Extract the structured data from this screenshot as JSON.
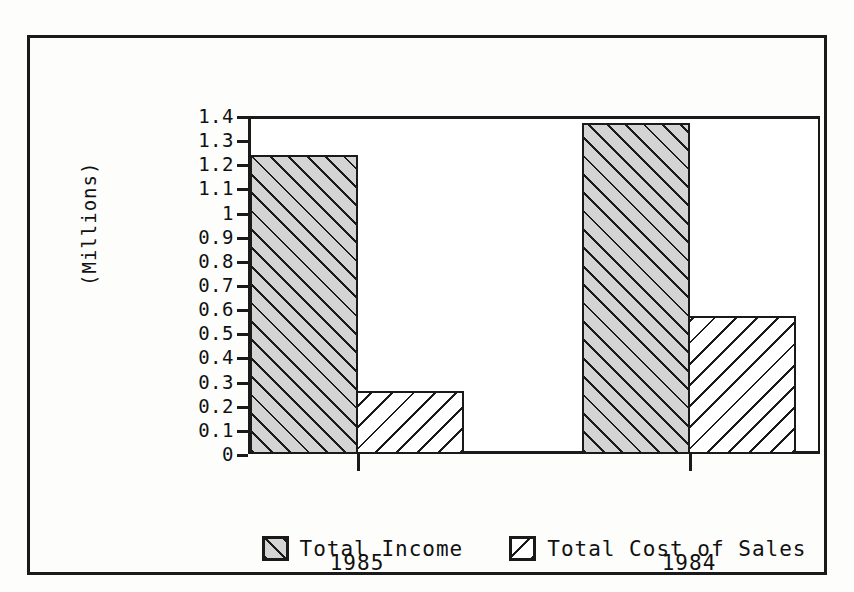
{
  "chart_data": {
    "type": "bar",
    "title": "",
    "xlabel": "",
    "ylabel": "(Millions)",
    "categories": [
      "1985",
      "1984"
    ],
    "series": [
      {
        "name": "Total Income",
        "values": [
          1.24,
          1.37
        ]
      },
      {
        "name": "Total Cost of Sales",
        "values": [
          0.26,
          0.57
        ]
      }
    ],
    "ylim": [
      0,
      1.4
    ],
    "ytick_values": [
      0,
      0.1,
      0.2,
      0.3,
      0.4,
      0.5,
      0.6,
      0.7,
      0.8,
      0.9,
      1,
      1.1,
      1.2,
      1.3,
      1.4
    ],
    "ytick_labels": [
      "0",
      "0.1",
      "0.2",
      "0.3",
      "0.4",
      "0.5",
      "0.6",
      "0.7",
      "0.8",
      "0.9",
      "1",
      "1.1",
      "1.2",
      "1.3",
      "1.4"
    ],
    "grid": false,
    "legend_position": "bottom",
    "colors": {
      "series_1_fill": "#d4d4d4",
      "series_2_fill": "#ffffff",
      "line": "#1a1a1a",
      "background": "#ffffff"
    },
    "hatch": [
      "forward-diagonal",
      "backward-diagonal"
    ]
  },
  "legend": {
    "items": [
      {
        "label": "Total Income"
      },
      {
        "label": "Total Cost of Sales"
      }
    ]
  },
  "axis": {
    "y_title": "(Millions)"
  },
  "caption": ""
}
